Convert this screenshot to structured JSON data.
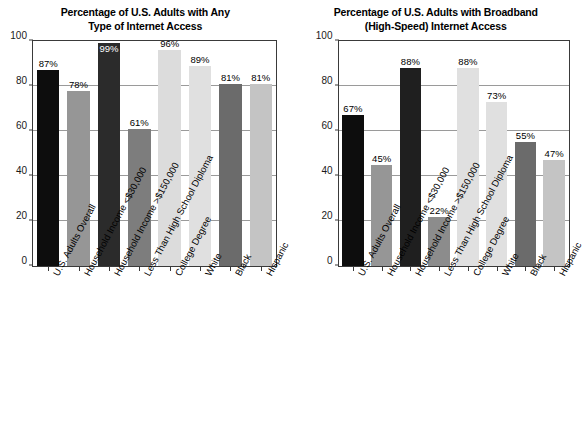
{
  "chart_data": [
    {
      "type": "bar",
      "title": "Percentage of U.S. Adults with Any\nType of Internet Access",
      "xlabel": "",
      "ylabel": "",
      "ylim": [
        0,
        100
      ],
      "yticks": [
        0,
        20,
        40,
        60,
        80,
        100
      ],
      "grid": true,
      "legend": "none",
      "categories": [
        "U.S. Adults Overall",
        "Household Income <$30,000",
        "Household Income >$150,000",
        "Less Than High School Diploma",
        "College Degree",
        "White",
        "Black",
        "Hispanic"
      ],
      "values": [
        87,
        78,
        99,
        61,
        96,
        89,
        81,
        81
      ],
      "value_labels": [
        "87%",
        "78%",
        "99%",
        "61%",
        "96%",
        "89%",
        "81%",
        "81%"
      ],
      "label_placement": [
        "above",
        "above",
        "inside",
        "above",
        "above",
        "above",
        "above",
        "above"
      ],
      "bar_colors": [
        "#0d0d0d",
        "#969696",
        "#2b2b2b",
        "#7d7d7d",
        "#dcdcdc",
        "#e0e0e0",
        "#6b6b6b",
        "#c4c4c4"
      ]
    },
    {
      "type": "bar",
      "title": "Percentage of U.S. Adults with Broadband\n(High-Speed) Internet Access",
      "xlabel": "",
      "ylabel": "",
      "ylim": [
        0,
        100
      ],
      "yticks": [
        0,
        20,
        40,
        60,
        80,
        100
      ],
      "grid": true,
      "legend": "none",
      "categories": [
        "U.S. Adults Overall",
        "Household Income <$30,000",
        "Household Income >$150,000",
        "Less Than High School Diploma",
        "College Degree",
        "White",
        "Black",
        "Hispanic"
      ],
      "values": [
        67,
        45,
        88,
        22,
        88,
        73,
        55,
        47
      ],
      "value_labels": [
        "67%",
        "45%",
        "88%",
        "22%",
        "88%",
        "73%",
        "55%",
        "47%"
      ],
      "label_placement": [
        "above",
        "above",
        "above",
        "above",
        "above",
        "above",
        "above",
        "above"
      ],
      "bar_colors": [
        "#0d0d0d",
        "#969696",
        "#1f1f1f",
        "#8c8c8c",
        "#e0e0e0",
        "#e0e0e0",
        "#6b6b6b",
        "#c4c4c4"
      ]
    }
  ],
  "colors": {
    "axis": "#3a3a3a",
    "grid": "#9a9a9a",
    "text": "#000000",
    "background": "#ffffff"
  }
}
